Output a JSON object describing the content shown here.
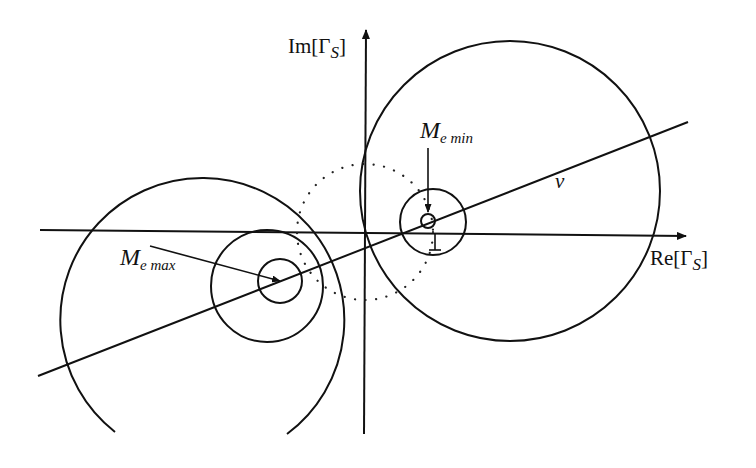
{
  "diagram": {
    "axes": {
      "real_label": "Re[Γ",
      "real_subscript": "S",
      "real_close": "]",
      "imag_label": "Im[Γ",
      "imag_subscript": "S",
      "imag_close": "]"
    },
    "labels": {
      "line_v": "v",
      "m_min_main": "M",
      "m_min_sub": "e min",
      "m_max_main": "M",
      "m_max_sub": "e max",
      "unit_tick": "1"
    },
    "colors": {
      "ink": "#111111",
      "background": "#ffffff"
    }
  }
}
